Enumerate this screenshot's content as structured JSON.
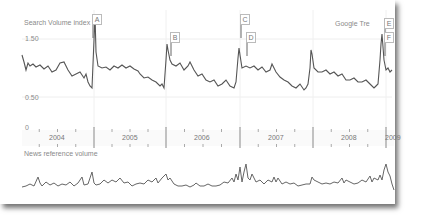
{
  "chart_data": [
    {
      "type": "line",
      "title": "Search Volume index",
      "source_label": "Google Tre",
      "yticks": [
        "1.50",
        "0.50",
        "0"
      ],
      "ylim": [
        0,
        2.0
      ],
      "x_categories": [
        "2004",
        "2005",
        "2006",
        "2007",
        "2008",
        "2009"
      ],
      "annotations": [
        "A",
        "B",
        "C",
        "D",
        "E",
        "F"
      ],
      "series": [
        {
          "name": "Search Volume index",
          "color": "#555555",
          "description": "Seasonal pattern with sharp annual spikes each January (~1.6) then decline to ~0.7 before next spike; baseline ~1.0",
          "points_xy": [
            [
              22,
              55
            ],
            [
              24,
              62
            ],
            [
              26,
              70
            ],
            [
              28,
              63
            ],
            [
              30,
              66
            ],
            [
              33,
              64
            ],
            [
              36,
              67
            ],
            [
              40,
              65
            ],
            [
              44,
              69
            ],
            [
              48,
              66
            ],
            [
              52,
              72
            ],
            [
              56,
              70
            ],
            [
              60,
              63
            ],
            [
              64,
              62
            ],
            [
              68,
              70
            ],
            [
              72,
              76
            ],
            [
              76,
              74
            ],
            [
              80,
              72
            ],
            [
              84,
              78
            ],
            [
              86,
              74
            ],
            [
              88,
              82
            ],
            [
              90,
              86
            ],
            [
              92,
              88
            ],
            [
              94,
              40
            ],
            [
              95,
              15
            ],
            [
              96,
              52
            ],
            [
              98,
              66
            ],
            [
              102,
              68
            ],
            [
              106,
              67
            ],
            [
              110,
              70
            ],
            [
              114,
              66
            ],
            [
              118,
              68
            ],
            [
              122,
              65
            ],
            [
              126,
              68
            ],
            [
              130,
              66
            ],
            [
              134,
              69
            ],
            [
              138,
              71
            ],
            [
              140,
              74
            ],
            [
              144,
              78
            ],
            [
              148,
              77
            ],
            [
              152,
              80
            ],
            [
              156,
              82
            ],
            [
              160,
              86
            ],
            [
              162,
              84
            ],
            [
              164,
              88
            ],
            [
              166,
              60
            ],
            [
              167,
              44
            ],
            [
              168,
              50
            ],
            [
              170,
              60
            ],
            [
              172,
              64
            ],
            [
              176,
              66
            ],
            [
              180,
              63
            ],
            [
              184,
              70
            ],
            [
              188,
              66
            ],
            [
              190,
              62
            ],
            [
              194,
              70
            ],
            [
              198,
              76
            ],
            [
              202,
              74
            ],
            [
              206,
              80
            ],
            [
              210,
              82
            ],
            [
              214,
              80
            ],
            [
              218,
              86
            ],
            [
              222,
              84
            ],
            [
              226,
              80
            ],
            [
              230,
              86
            ],
            [
              234,
              88
            ],
            [
              236,
              82
            ],
            [
              238,
              58
            ],
            [
              239,
              48
            ],
            [
              240,
              55
            ],
            [
              242,
              68
            ],
            [
              246,
              66
            ],
            [
              250,
              68
            ],
            [
              254,
              66
            ],
            [
              258,
              70
            ],
            [
              262,
              67
            ],
            [
              266,
              72
            ],
            [
              270,
              70
            ],
            [
              272,
              64
            ],
            [
              276,
              72
            ],
            [
              280,
              77
            ],
            [
              284,
              80
            ],
            [
              288,
              82
            ],
            [
              292,
              86
            ],
            [
              296,
              88
            ],
            [
              300,
              84
            ],
            [
              304,
              90
            ],
            [
              306,
              88
            ],
            [
              308,
              84
            ],
            [
              310,
              68
            ],
            [
              311,
              50
            ],
            [
              312,
              54
            ],
            [
              314,
              68
            ],
            [
              318,
              72
            ],
            [
              322,
              72
            ],
            [
              326,
              70
            ],
            [
              330,
              74
            ],
            [
              334,
              72
            ],
            [
              338,
              76
            ],
            [
              342,
              74
            ],
            [
              346,
              80
            ],
            [
              350,
              80
            ],
            [
              354,
              78
            ],
            [
              358,
              82
            ],
            [
              362,
              82
            ],
            [
              366,
              80
            ],
            [
              370,
              84
            ],
            [
              374,
              88
            ],
            [
              376,
              86
            ],
            [
              378,
              84
            ],
            [
              380,
              60
            ],
            [
              381,
              44
            ],
            [
              382,
              34
            ],
            [
              384,
              60
            ],
            [
              386,
              70
            ],
            [
              388,
              68
            ],
            [
              390,
              72
            ],
            [
              392,
              70
            ]
          ]
        },
        {
          "name": "News reference volume",
          "color": "#666666",
          "points_xy": [
            [
              22,
              187
            ],
            [
              26,
              186
            ],
            [
              30,
              184
            ],
            [
              34,
              186
            ],
            [
              38,
              177
            ],
            [
              40,
              183
            ],
            [
              42,
              186
            ],
            [
              46,
              182
            ],
            [
              50,
              185
            ],
            [
              54,
              183
            ],
            [
              58,
              186
            ],
            [
              62,
              184
            ],
            [
              66,
              185
            ],
            [
              70,
              182
            ],
            [
              74,
              186
            ],
            [
              78,
              183
            ],
            [
              82,
              177
            ],
            [
              84,
              185
            ],
            [
              88,
              184
            ],
            [
              92,
              172
            ],
            [
              94,
              183
            ],
            [
              96,
              185
            ],
            [
              100,
              184
            ],
            [
              104,
              180
            ],
            [
              108,
              183
            ],
            [
              112,
              180
            ],
            [
              116,
              182
            ],
            [
              120,
              178
            ],
            [
              124,
              183
            ],
            [
              128,
              182
            ],
            [
              132,
              186
            ],
            [
              136,
              184
            ],
            [
              140,
              183
            ],
            [
              144,
              184
            ],
            [
              148,
              180
            ],
            [
              152,
              182
            ],
            [
              156,
              178
            ],
            [
              158,
              183
            ],
            [
              162,
              178
            ],
            [
              166,
              174
            ],
            [
              168,
              180
            ],
            [
              170,
              178
            ],
            [
              174,
              184
            ],
            [
              178,
              186
            ],
            [
              182,
              186
            ],
            [
              186,
              185
            ],
            [
              190,
              187
            ],
            [
              194,
              185
            ],
            [
              196,
              183
            ],
            [
              200,
              186
            ],
            [
              204,
              186
            ],
            [
              208,
              184
            ],
            [
              212,
              186
            ],
            [
              216,
              186
            ],
            [
              220,
              185
            ],
            [
              224,
              182
            ],
            [
              228,
              183
            ],
            [
              232,
              178
            ],
            [
              234,
              182
            ],
            [
              236,
              174
            ],
            [
              238,
              180
            ],
            [
              240,
              167
            ],
            [
              242,
              182
            ],
            [
              244,
              172
            ],
            [
              246,
              164
            ],
            [
              248,
              178
            ],
            [
              250,
              180
            ],
            [
              252,
              174
            ],
            [
              256,
              182
            ],
            [
              260,
              180
            ],
            [
              264,
              184
            ],
            [
              268,
              180
            ],
            [
              272,
              182
            ],
            [
              274,
              177
            ],
            [
              276,
              182
            ],
            [
              278,
              178
            ],
            [
              282,
              184
            ],
            [
              286,
              182
            ],
            [
              290,
              184
            ],
            [
              294,
              183
            ],
            [
              298,
              186
            ],
            [
              302,
              185
            ],
            [
              306,
              184
            ],
            [
              310,
              184
            ],
            [
              312,
              177
            ],
            [
              314,
              180
            ],
            [
              318,
              182
            ],
            [
              322,
              184
            ],
            [
              326,
              183
            ],
            [
              330,
              184
            ],
            [
              334,
              182
            ],
            [
              338,
              183
            ],
            [
              342,
              178
            ],
            [
              344,
              183
            ],
            [
              346,
              180
            ],
            [
              350,
              182
            ],
            [
              354,
              184
            ],
            [
              358,
              183
            ],
            [
              362,
              180
            ],
            [
              366,
              182
            ],
            [
              370,
              176
            ],
            [
              372,
              182
            ],
            [
              374,
              178
            ],
            [
              378,
              180
            ],
            [
              380,
              175
            ],
            [
              382,
              180
            ],
            [
              384,
              170
            ],
            [
              386,
              164
            ],
            [
              388,
              172
            ],
            [
              390,
              176
            ],
            [
              392,
              184
            ],
            [
              394,
              190
            ]
          ]
        }
      ],
      "year_dividers_x": [
        94,
        166,
        240,
        313,
        386
      ],
      "year_label_x": [
        57,
        130,
        202,
        276,
        349,
        393
      ]
    }
  ],
  "labels": {
    "search_title": "Search Volume index",
    "source": "Google Tre",
    "news_title": "News reference volume",
    "y_high": "1.50",
    "y_low": "0.50",
    "y_zero": "0"
  },
  "markers": [
    {
      "id": "A",
      "x": 92,
      "y": 14
    },
    {
      "id": "B",
      "x": 170,
      "y": 32
    },
    {
      "id": "C",
      "x": 240,
      "y": 14
    },
    {
      "id": "D",
      "x": 246,
      "y": 32
    },
    {
      "id": "E",
      "x": 384,
      "y": 18
    },
    {
      "id": "F",
      "x": 384,
      "y": 32
    }
  ],
  "years": [
    "2004",
    "2005",
    "2006",
    "2007",
    "2008",
    "2009"
  ]
}
